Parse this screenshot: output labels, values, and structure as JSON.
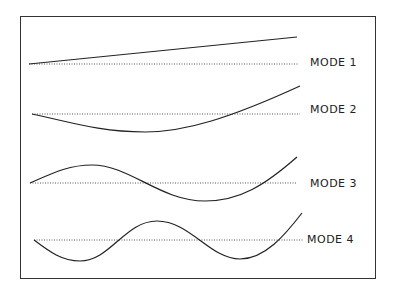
{
  "modes": [
    {
      "label": "MODE 1",
      "baseline_y": 64,
      "label_x": 310,
      "label_y": 56
    },
    {
      "label": "MODE 2",
      "baseline_y": 114,
      "label_x": 310,
      "label_y": 103
    },
    {
      "label": "MODE 3",
      "baseline_y": 183,
      "label_x": 310,
      "label_y": 177
    },
    {
      "label": "MODE 4",
      "baseline_y": 240,
      "label_x": 307,
      "label_y": 233
    }
  ],
  "colors": {
    "line": "#222222",
    "frame": "#333333"
  }
}
